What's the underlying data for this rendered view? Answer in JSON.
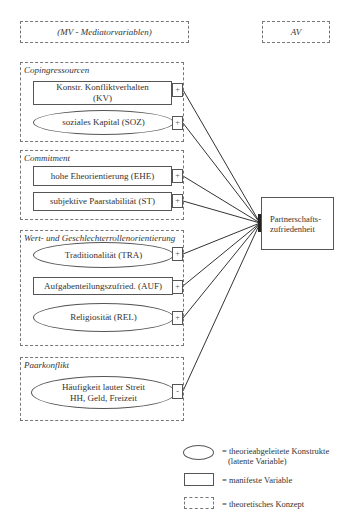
{
  "header": {
    "mediator_label": "(MV - Mediatorvariablen)",
    "outcome_label": "AV"
  },
  "groups": [
    {
      "title": "Copingressourcen",
      "items": [
        {
          "shape": "rect",
          "label_line1": "Konstr. Konfliktverhalten",
          "label_line2": "(KV)",
          "sign": "+"
        },
        {
          "shape": "ellipse",
          "label_line1": "soziales Kapital (SOZ)",
          "label_line2": "",
          "sign": "+"
        }
      ]
    },
    {
      "title": "Commitment",
      "items": [
        {
          "shape": "rect",
          "label_line1": "hohe Eheorientierung (EHE)",
          "label_line2": "",
          "sign": "+"
        },
        {
          "shape": "rect",
          "label_line1": "subjektive Paarstabilität (ST)",
          "label_line2": "",
          "sign": "+"
        }
      ]
    },
    {
      "title": "Wert- und Geschlechterrollenorientierung",
      "items": [
        {
          "shape": "ellipse",
          "label_line1": "Traditionalität (TRA)",
          "label_line2": "",
          "sign": "+"
        },
        {
          "shape": "rect",
          "label_line1": "Aufgabenteilungszufried. (AUF)",
          "label_line2": "",
          "sign": "+"
        },
        {
          "shape": "ellipse",
          "label_line1": "Religiosität (REL)",
          "label_line2": "",
          "sign": "+"
        }
      ]
    },
    {
      "title": "Paarkonflikt",
      "items": [
        {
          "shape": "ellipse",
          "label_line1": "Häufigkeit lauter Streit",
          "label_line2": "HH, Geld, Freizeit",
          "sign": "-"
        }
      ]
    }
  ],
  "outcome": {
    "label_line1": "Partnerschafts-",
    "label_line2": "zufriedenheit"
  },
  "legend": {
    "ellipse_line1": "= theorieabgeleitete Konstrukte",
    "ellipse_line2": "(latente Variable)",
    "rect": "= manifeste Variable",
    "dashed": "= theoretisches Konzept"
  },
  "colors": {
    "line": "#333333",
    "dashed_border": "#777777",
    "background": "#ffffff"
  }
}
